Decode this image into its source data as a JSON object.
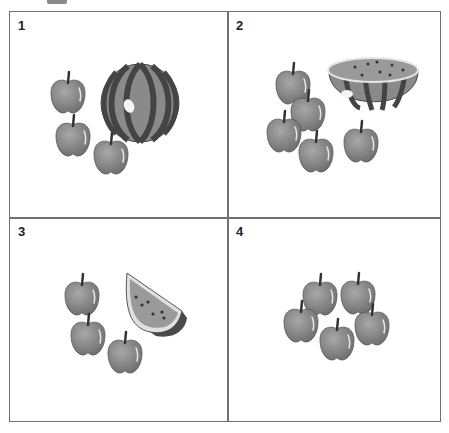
{
  "panels": [
    {
      "number": "1",
      "contents": {
        "apples": 3,
        "watermelon": "whole"
      }
    },
    {
      "number": "2",
      "contents": {
        "apples": 5,
        "watermelon": "half"
      }
    },
    {
      "number": "3",
      "contents": {
        "apples": 3,
        "watermelon": "slice"
      }
    },
    {
      "number": "4",
      "contents": {
        "apples": 5,
        "watermelon": "none"
      }
    }
  ],
  "colors": {
    "border": "#707070",
    "apple": "#8c8c8c",
    "melon_dark": "#4a4a4a",
    "melon_light": "#8a8a8a",
    "flesh": "#9a9a9a"
  }
}
